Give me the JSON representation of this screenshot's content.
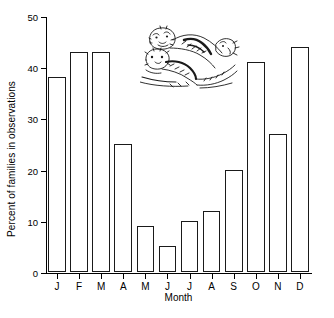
{
  "chart_data": {
    "type": "bar",
    "title": "",
    "xlabel": "Month",
    "ylabel": "Percent of families in observations",
    "categories": [
      "J",
      "F",
      "M",
      "A",
      "M",
      "J",
      "J",
      "A",
      "S",
      "O",
      "N",
      "D"
    ],
    "category_names": [
      "January",
      "February",
      "March",
      "April",
      "May",
      "June",
      "July",
      "August",
      "September",
      "October",
      "November",
      "December"
    ],
    "values": [
      38,
      43,
      43,
      25,
      9,
      5,
      10,
      12,
      20,
      41,
      27,
      44
    ],
    "ylim": [
      0,
      50
    ],
    "yticks": [
      0,
      10,
      20,
      30,
      40,
      50
    ],
    "ytick_labels": [
      "0",
      "10",
      "20",
      "30",
      "40",
      "50"
    ],
    "grid": false,
    "legend": null,
    "bar_style": {
      "fill": "#ffffff",
      "edge": "#1a1a1a"
    },
    "annotations": [
      {
        "name": "otter-illustration",
        "description": "line-art drawing of otters"
      }
    ]
  }
}
